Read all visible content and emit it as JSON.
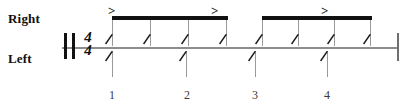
{
  "score": {
    "title": "single-line percussion rhythm staff",
    "time_signature": {
      "numerator": "4",
      "denominator": "4"
    },
    "labels": {
      "right_hand": "Right",
      "left_hand": "Left"
    },
    "colors": {
      "ink": "#111111",
      "staff": "#8d8d8d",
      "stem": "#9a9a9a",
      "beat_number": "#3a3a3a",
      "background": "#ffffff"
    },
    "staff": {
      "y": 47,
      "x_start": 62,
      "x_end": 398
    },
    "barlines": [
      {
        "name": "double-barline-left-1",
        "x": 64,
        "y": 33,
        "height": 26,
        "style": "thick"
      },
      {
        "name": "double-barline-left-2",
        "x": 72,
        "y": 33,
        "height": 26,
        "style": "thick"
      },
      {
        "name": "final-barline",
        "x": 397,
        "y": 33,
        "height": 28,
        "style": "thin"
      }
    ],
    "time_signature_pos": {
      "x": 80,
      "y": 31
    },
    "beams": [
      {
        "name": "beam-group-1",
        "x": 112,
        "y": 16,
        "width": 116
      },
      {
        "name": "beam-group-2",
        "x": 262,
        "y": 16,
        "width": 110
      }
    ],
    "right_hand_notes": [
      {
        "index": 1,
        "x": 112,
        "beam_group": 1,
        "accent": true,
        "duration": "eighth"
      },
      {
        "index": 2,
        "x": 150,
        "beam_group": 1,
        "accent": false,
        "duration": "eighth"
      },
      {
        "index": 3,
        "x": 188,
        "beam_group": 1,
        "accent": false,
        "duration": "eighth"
      },
      {
        "index": 4,
        "x": 226,
        "beam_group": 1,
        "accent": true,
        "duration": "eighth"
      },
      {
        "index": 5,
        "x": 262,
        "beam_group": 2,
        "accent": false,
        "duration": "eighth"
      },
      {
        "index": 6,
        "x": 298,
        "beam_group": 2,
        "accent": false,
        "duration": "eighth"
      },
      {
        "index": 7,
        "x": 334,
        "beam_group": 2,
        "accent": true,
        "duration": "eighth"
      },
      {
        "index": 8,
        "x": 370,
        "beam_group": 2,
        "accent": false,
        "duration": "eighth"
      }
    ],
    "left_hand_notes": [
      {
        "index": 1,
        "x": 112,
        "duration": "quarter"
      },
      {
        "index": 2,
        "x": 186,
        "duration": "quarter"
      },
      {
        "index": 3,
        "x": 255,
        "duration": "quarter"
      },
      {
        "index": 4,
        "x": 327,
        "duration": "quarter"
      }
    ],
    "accents": [
      {
        "name": "accent-1",
        "symbol": ">",
        "x": 108,
        "y": 4
      },
      {
        "name": "accent-2",
        "symbol": ">",
        "x": 211,
        "y": 4
      },
      {
        "name": "accent-3",
        "symbol": ">",
        "x": 321,
        "y": 4
      }
    ],
    "beat_numbers": [
      {
        "label": "1",
        "x": 105,
        "y": 88
      },
      {
        "label": "2",
        "x": 180,
        "y": 88
      },
      {
        "label": "3",
        "x": 248,
        "y": 88
      },
      {
        "label": "4",
        "x": 320,
        "y": 88
      }
    ]
  }
}
